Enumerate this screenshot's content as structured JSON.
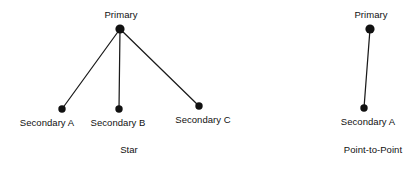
{
  "figure": {
    "background_color": "#ffffff",
    "line_color": "#1a1a1a",
    "node_color": "#111111",
    "text_color": "#111111"
  },
  "diagrams": [
    {
      "id": "star",
      "caption": "Star",
      "caption_pos": {
        "x": 129,
        "y": 144
      },
      "nodes": [
        {
          "id": "star-primary",
          "label": "Primary",
          "cx": 120,
          "cy": 29,
          "r": 4.6,
          "label_x": 121,
          "label_y": 9
        },
        {
          "id": "star-secondary-a",
          "label": "Secondary A",
          "cx": 62,
          "cy": 109,
          "r": 3.7,
          "label_x": 47,
          "label_y": 117
        },
        {
          "id": "star-secondary-b",
          "label": "Secondary B",
          "cx": 119,
          "cy": 109,
          "r": 3.7,
          "label_x": 118,
          "label_y": 117
        },
        {
          "id": "star-secondary-c",
          "label": "Secondary C",
          "cx": 199,
          "cy": 106,
          "r": 3.7,
          "label_x": 203,
          "label_y": 114
        }
      ],
      "links": [
        {
          "from": "star-primary",
          "to": "star-secondary-a",
          "x1": 120,
          "y1": 29,
          "x2": 62,
          "y2": 109
        },
        {
          "from": "star-primary",
          "to": "star-secondary-b",
          "x1": 120,
          "y1": 29,
          "x2": 119,
          "y2": 109
        },
        {
          "from": "star-primary",
          "to": "star-secondary-c",
          "x1": 120,
          "y1": 29,
          "x2": 199,
          "y2": 106
        }
      ]
    },
    {
      "id": "point-to-point",
      "caption": "Point-to-Point",
      "caption_pos": {
        "x": 373,
        "y": 144
      },
      "nodes": [
        {
          "id": "ptp-primary",
          "label": "Primary",
          "cx": 370,
          "cy": 29,
          "r": 4.6,
          "label_x": 371,
          "label_y": 9
        },
        {
          "id": "ptp-secondary-a",
          "label": "Secondary A",
          "cx": 364,
          "cy": 108,
          "r": 3.7,
          "label_x": 368,
          "label_y": 116
        }
      ],
      "links": [
        {
          "from": "ptp-primary",
          "to": "ptp-secondary-a",
          "x1": 370,
          "y1": 29,
          "x2": 364,
          "y2": 108
        }
      ]
    }
  ]
}
